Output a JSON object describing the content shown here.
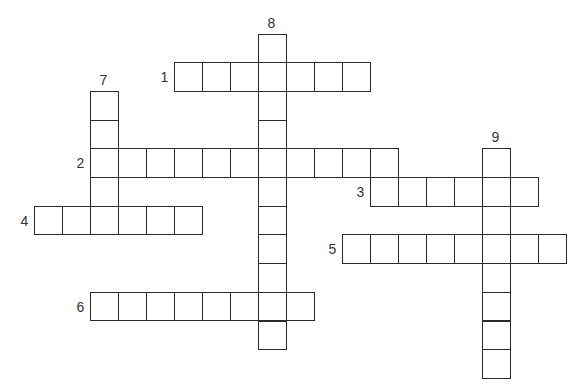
{
  "puzzle": {
    "title": "",
    "entries": [
      {
        "number": "1",
        "direction": "across",
        "length": 7,
        "start": {
          "row": 1,
          "col": 5
        }
      },
      {
        "number": "2",
        "direction": "across",
        "length": 11,
        "start": {
          "row": 4,
          "col": 2
        }
      },
      {
        "number": "3",
        "direction": "across",
        "length": 6,
        "start": {
          "row": 5,
          "col": 12
        }
      },
      {
        "number": "4",
        "direction": "across",
        "length": 6,
        "start": {
          "row": 6,
          "col": 0
        }
      },
      {
        "number": "5",
        "direction": "across",
        "length": 8,
        "start": {
          "row": 7,
          "col": 11
        }
      },
      {
        "number": "6",
        "direction": "across",
        "length": 8,
        "start": {
          "row": 9,
          "col": 2
        }
      },
      {
        "number": "7",
        "direction": "down",
        "length": 5,
        "start": {
          "row": 2,
          "col": 2
        }
      },
      {
        "number": "8",
        "direction": "down",
        "length": 11,
        "start": {
          "row": 0,
          "col": 8
        }
      },
      {
        "number": "9",
        "direction": "down",
        "length": 8,
        "start": {
          "row": 4,
          "col": 16
        }
      }
    ]
  }
}
